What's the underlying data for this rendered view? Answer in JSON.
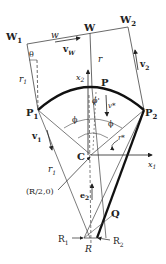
{
  "diagram": {
    "points": {
      "W1": "W",
      "W1_sub": "1",
      "W": "W",
      "W2": "W",
      "W2_sub": "2",
      "P1": "P",
      "P1_sub": "1",
      "P": "P",
      "P2": "P",
      "P2_sub": "2",
      "C": "C",
      "Q": "Q",
      "R1": "R",
      "R1_sub": "1",
      "R2": "R",
      "R2_sub": "2",
      "R": "R"
    },
    "labels": {
      "w": "w",
      "vW": "v",
      "vW_sub": "W",
      "v2": "v",
      "v2_sub": "2",
      "theta": "θ",
      "r1": "r",
      "r1_sub": "1",
      "r": "r",
      "x2": "x",
      "x2_sub": "2",
      "x1": "x",
      "x1_sub": "1",
      "phi_left": "ϕ",
      "phi_right": "ϕ",
      "phi_prime": "ϕ'",
      "vstar": "v*",
      "v1star": "v",
      "v1star_sub": "1",
      "v1star_sup": "*",
      "r1star": "r",
      "r1star_sub": "1",
      "r1star_sup": "*",
      "rstar": "r*",
      "e2": "e",
      "e2_sub": "2",
      "coord": "(R/2,0)"
    },
    "colors": {
      "line": "#333333",
      "thick": "#111111"
    }
  }
}
